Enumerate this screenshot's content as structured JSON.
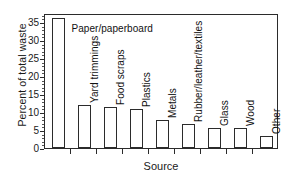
{
  "chart_data": {
    "type": "bar",
    "title": "",
    "xlabel": "Source",
    "ylabel": "Percent of total waste",
    "categories": [
      "Paper/paperboard",
      "Yard trimmings",
      "Food scraps",
      "Plastics",
      "Metals",
      "Rubber/leather/textiles",
      "Glass",
      "Wood",
      "Other"
    ],
    "values": [
      36.2,
      11.9,
      11.3,
      10.8,
      7.8,
      6.7,
      5.5,
      5.5,
      3.3
    ],
    "ylim": [
      0,
      37.5
    ],
    "yticks": [
      0,
      5,
      10,
      15,
      20,
      25,
      30,
      35
    ],
    "ytick_labels": [
      "0",
      "5",
      "10",
      "15",
      "20",
      "25",
      "30",
      "35"
    ],
    "grid": false,
    "legend": "none",
    "bar_face_color": "#ffffff",
    "bar_edge_color": "#2b2b2b",
    "axis_color": "#2b2b2b",
    "label_orientation": [
      "horizontal",
      "vertical",
      "vertical",
      "vertical",
      "vertical",
      "vertical",
      "vertical",
      "vertical",
      "vertical"
    ]
  }
}
